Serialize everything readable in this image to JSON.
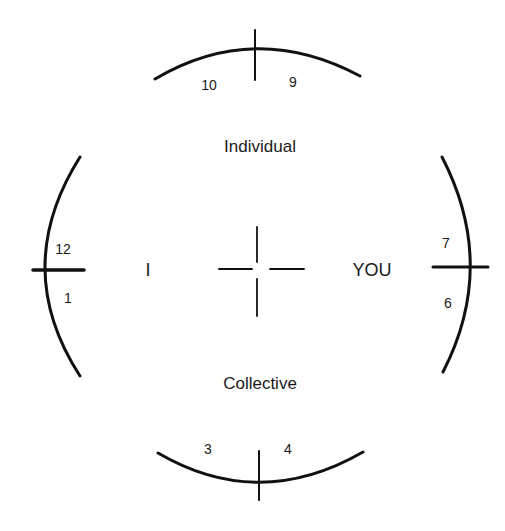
{
  "diagram": {
    "type": "circular quadrant diagram",
    "center_labels": {
      "top": "Individual",
      "bottom": "Collective",
      "left": "I",
      "right": "YOU"
    },
    "clock_positions": {
      "top_left": "10",
      "top_right": "9",
      "left_top": "12",
      "left_bottom": "1",
      "right_top": "7",
      "right_bottom": "6",
      "bottom_left": "3",
      "bottom_right": "4"
    },
    "line_color": "#111111",
    "background": "#ffffff"
  }
}
